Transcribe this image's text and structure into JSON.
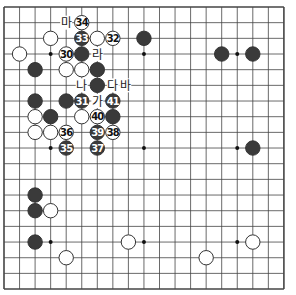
{
  "board": {
    "size": 19,
    "origin_x": 4,
    "origin_y": 7,
    "step_x": 15.55,
    "step_y": 15.67,
    "colors": {
      "line": "#444444",
      "black": "#3a3a3a",
      "white": "#ffffff",
      "stone_outline": "#333333"
    },
    "star_points": [
      [
        3,
        3
      ],
      [
        9,
        3
      ],
      [
        15,
        3
      ],
      [
        3,
        9
      ],
      [
        9,
        9
      ],
      [
        15,
        9
      ],
      [
        3,
        15
      ],
      [
        9,
        15
      ],
      [
        15,
        15
      ]
    ]
  },
  "stones": [
    {
      "color": "white",
      "col": 3,
      "row": 2,
      "num": ""
    },
    {
      "color": "white",
      "col": 1,
      "row": 3,
      "num": ""
    },
    {
      "color": "black",
      "col": 9,
      "row": 2,
      "num": ""
    },
    {
      "color": "black",
      "col": 14,
      "row": 3,
      "num": ""
    },
    {
      "color": "black",
      "col": 16,
      "row": 3,
      "num": ""
    },
    {
      "color": "white",
      "col": 5,
      "row": 1,
      "num": "34"
    },
    {
      "color": "black",
      "col": 5,
      "row": 2,
      "num": "33"
    },
    {
      "color": "white",
      "col": 6,
      "row": 2,
      "num": ""
    },
    {
      "color": "white",
      "col": 7,
      "row": 2,
      "num": "32"
    },
    {
      "color": "white",
      "col": 4,
      "row": 3,
      "num": "30"
    },
    {
      "color": "black",
      "col": 5,
      "row": 3,
      "num": ""
    },
    {
      "color": "black",
      "col": 2,
      "row": 4,
      "num": ""
    },
    {
      "color": "white",
      "col": 4,
      "row": 4,
      "num": ""
    },
    {
      "color": "white",
      "col": 5,
      "row": 4,
      "num": ""
    },
    {
      "color": "black",
      "col": 6,
      "row": 4,
      "num": ""
    },
    {
      "color": "black",
      "col": 6,
      "row": 5,
      "num": ""
    },
    {
      "color": "black",
      "col": 2,
      "row": 6,
      "num": ""
    },
    {
      "color": "black",
      "col": 4,
      "row": 6,
      "num": ""
    },
    {
      "color": "black",
      "col": 5,
      "row": 6,
      "num": "31"
    },
    {
      "color": "black",
      "col": 7,
      "row": 6,
      "num": "41"
    },
    {
      "color": "white",
      "col": 2,
      "row": 7,
      "num": ""
    },
    {
      "color": "black",
      "col": 3,
      "row": 7,
      "num": ""
    },
    {
      "color": "white",
      "col": 5,
      "row": 7,
      "num": ""
    },
    {
      "color": "white",
      "col": 6,
      "row": 7,
      "num": "40"
    },
    {
      "color": "black",
      "col": 7,
      "row": 7,
      "num": ""
    },
    {
      "color": "white",
      "col": 2,
      "row": 8,
      "num": ""
    },
    {
      "color": "white",
      "col": 3,
      "row": 8,
      "num": ""
    },
    {
      "color": "white",
      "col": 4,
      "row": 8,
      "num": "36"
    },
    {
      "color": "black",
      "col": 6,
      "row": 8,
      "num": "39"
    },
    {
      "color": "white",
      "col": 7,
      "row": 8,
      "num": "38"
    },
    {
      "color": "black",
      "col": 4,
      "row": 9,
      "num": "35"
    },
    {
      "color": "black",
      "col": 6,
      "row": 9,
      "num": "37"
    },
    {
      "color": "black",
      "col": 16,
      "row": 9,
      "num": ""
    },
    {
      "color": "black",
      "col": 2,
      "row": 12,
      "num": ""
    },
    {
      "color": "black",
      "col": 2,
      "row": 13,
      "num": ""
    },
    {
      "color": "white",
      "col": 3,
      "row": 13,
      "num": ""
    },
    {
      "color": "black",
      "col": 2,
      "row": 15,
      "num": ""
    },
    {
      "color": "white",
      "col": 8,
      "row": 15,
      "num": ""
    },
    {
      "color": "white",
      "col": 16,
      "row": 15,
      "num": ""
    },
    {
      "color": "white",
      "col": 4,
      "row": 16,
      "num": ""
    },
    {
      "color": "white",
      "col": 13,
      "row": 16,
      "num": ""
    }
  ],
  "labels": [
    {
      "text": "마",
      "col": 4,
      "row": 1
    },
    {
      "text": "라",
      "col": 6,
      "row": 3
    },
    {
      "text": "나",
      "col": 5,
      "row": 5
    },
    {
      "text": "다",
      "col": 7,
      "row": 5
    },
    {
      "text": "바",
      "col": 7.8,
      "row": 5
    },
    {
      "text": "가",
      "col": 6,
      "row": 6
    }
  ]
}
